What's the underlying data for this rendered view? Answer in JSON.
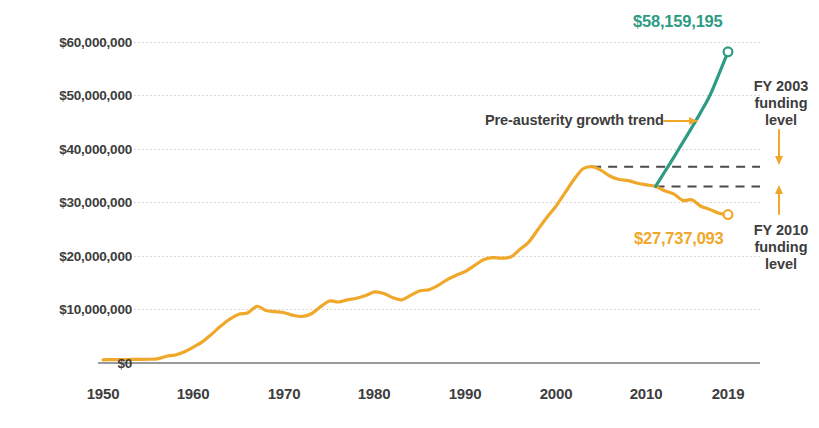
{
  "chart_data": {
    "type": "line",
    "title": "",
    "subtitle": "",
    "xlabel": "",
    "ylabel": "",
    "xlim": [
      1950,
      2019
    ],
    "ylim": [
      0,
      63000000
    ],
    "grid": true,
    "legend_position": "none",
    "y_ticks": [
      {
        "value": 0,
        "label": "$0"
      },
      {
        "value": 10000000,
        "label": "$10,000,000"
      },
      {
        "value": 20000000,
        "label": "$20,000,000"
      },
      {
        "value": 30000000,
        "label": "$30,000,000"
      },
      {
        "value": 40000000,
        "label": "$40,000,000"
      },
      {
        "value": 50000000,
        "label": "$50,000,000"
      },
      {
        "value": 60000000,
        "label": "$60,000,000"
      }
    ],
    "x_ticks": [
      {
        "value": 1950,
        "label": "1950"
      },
      {
        "value": 1960,
        "label": "1960"
      },
      {
        "value": 1970,
        "label": "1970"
      },
      {
        "value": 1980,
        "label": "1980"
      },
      {
        "value": 1990,
        "label": "1990"
      },
      {
        "value": 2000,
        "label": "2000"
      },
      {
        "value": 2010,
        "label": "2010"
      },
      {
        "value": 2019,
        "label": "2019"
      }
    ],
    "series": [
      {
        "name": "Actual funding",
        "color": "#EFA829",
        "end_marker": true,
        "x": [
          1950,
          1951,
          1952,
          1953,
          1954,
          1955,
          1956,
          1957,
          1958,
          1959,
          1960,
          1961,
          1962,
          1963,
          1964,
          1965,
          1966,
          1967,
          1968,
          1969,
          1970,
          1971,
          1972,
          1973,
          1974,
          1975,
          1976,
          1977,
          1978,
          1979,
          1980,
          1981,
          1982,
          1983,
          1984,
          1985,
          1986,
          1987,
          1988,
          1989,
          1990,
          1991,
          1992,
          1993,
          1994,
          1995,
          1996,
          1997,
          1998,
          1999,
          2000,
          2001,
          2002,
          2003,
          2004,
          2005,
          2006,
          2007,
          2008,
          2009,
          2010,
          2011,
          2012,
          2013,
          2014,
          2015,
          2016,
          2017,
          2018,
          2019
        ],
        "values": [
          600000,
          620000,
          640000,
          660000,
          680000,
          700000,
          760000,
          1250000,
          1500000,
          2100000,
          3000000,
          4000000,
          5400000,
          6900000,
          8200000,
          9100000,
          9400000,
          10600000,
          9800000,
          9600000,
          9400000,
          8900000,
          8700000,
          9200000,
          10500000,
          11600000,
          11400000,
          11800000,
          12100000,
          12600000,
          13300000,
          13000000,
          12200000,
          11800000,
          12700000,
          13500000,
          13700000,
          14500000,
          15600000,
          16400000,
          17100000,
          18200000,
          19300000,
          19700000,
          19600000,
          19800000,
          21200000,
          22600000,
          24900000,
          27200000,
          29300000,
          31800000,
          34300000,
          36300000,
          36700000,
          36000000,
          34900000,
          34300000,
          34100000,
          33600000,
          33300000,
          33000000,
          32200000,
          31600000,
          30400000,
          30500000,
          29300000,
          28700000,
          28000000,
          27737093
        ]
      },
      {
        "name": "Pre-austerity growth trend",
        "color": "#2E9B84",
        "end_marker": true,
        "x": [
          2011,
          2012,
          2013,
          2014,
          2015,
          2016,
          2017,
          2018,
          2019
        ],
        "values": [
          33000000,
          35700000,
          38400000,
          41200000,
          44000000,
          46900000,
          50000000,
          54000000,
          58159195
        ]
      }
    ],
    "reference_lines": [
      {
        "name": "FY 2003 funding level",
        "value": 36700000,
        "x_start": 2004,
        "x_end": 2019,
        "style": "dashed",
        "color": "#4a4a4a"
      },
      {
        "name": "FY 2010 funding level",
        "value": 33000000,
        "x_start": 2011,
        "x_end": 2019,
        "style": "dashed",
        "color": "#4a4a4a"
      }
    ],
    "annotations": [
      {
        "name": "green-endpoint-value",
        "text": "$58,159,195",
        "color": "#2E9B84",
        "at": {
          "x": 2019,
          "y": 58159195
        }
      },
      {
        "name": "orange-endpoint-value",
        "text": "$27,737,093",
        "color": "#EFA829",
        "at": {
          "x": 2019,
          "y": 27737093
        }
      },
      {
        "name": "trend-annotation",
        "text": "Pre-austerity growth trend",
        "color": "#3d3d3d"
      },
      {
        "name": "fy2003-annotation",
        "text": "FY 2003\nfunding\nlevel",
        "color": "#3d3d3d"
      },
      {
        "name": "fy2010-annotation",
        "text": "FY 2010\nfunding\nlevel",
        "color": "#3d3d3d"
      }
    ],
    "colors": {
      "actual": "#EFA829",
      "trend": "#2E9B84",
      "text": "#3d3d3d",
      "gridline": "#d8d8d8",
      "axis": "#9a9a9a",
      "reference": "#4a4a4a",
      "background": "#ffffff"
    }
  }
}
